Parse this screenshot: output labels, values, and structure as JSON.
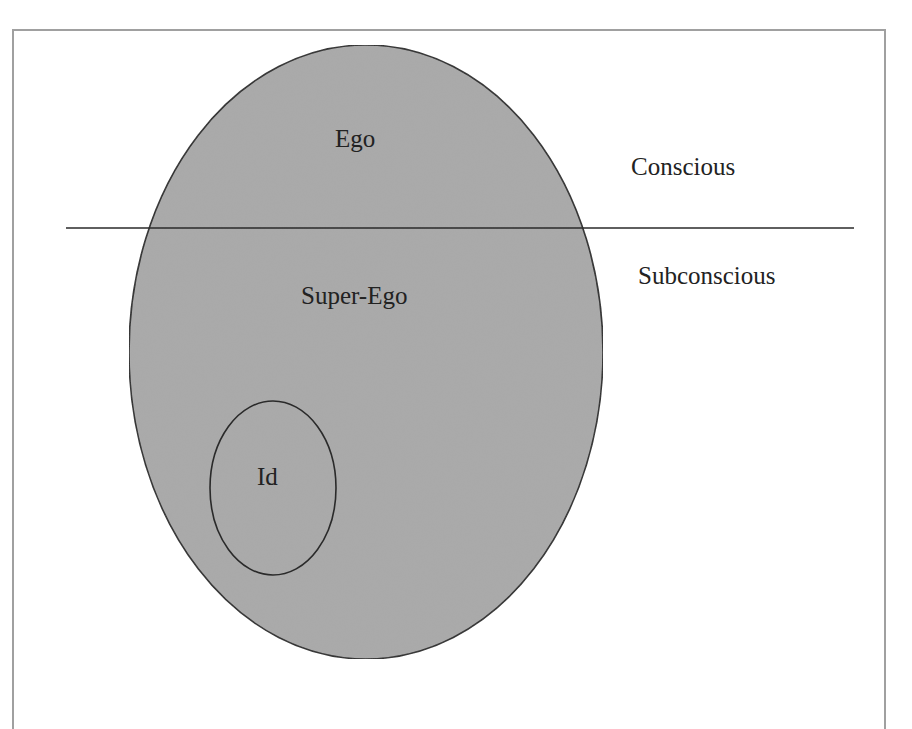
{
  "diagram": {
    "title": "",
    "colors": {
      "background": "#ffffff",
      "frame": "#a0a0a0",
      "fill": "#a9a9a9",
      "stroke": "#2a2a2a",
      "text": "#222222"
    },
    "outer_shape": {
      "type": "ellipse",
      "cx": 366,
      "cy": 352,
      "rx": 237,
      "ry": 307
    },
    "inner_shape": {
      "type": "ellipse",
      "cx": 273,
      "cy": 488,
      "rx": 63,
      "ry": 87
    },
    "divider": {
      "x1": 66,
      "y1": 228,
      "x2": 854,
      "y2": 228
    },
    "labels": {
      "ego": "Ego",
      "super_ego": "Super-Ego",
      "id": "Id",
      "conscious": "Conscious",
      "subconscious": "Subconscious"
    }
  }
}
